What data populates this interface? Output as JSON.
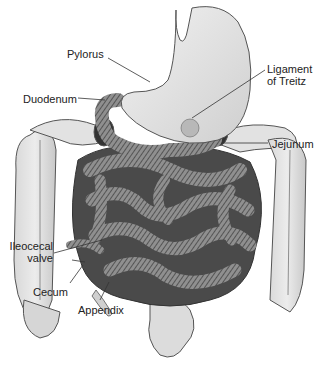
{
  "labels": {
    "pylorus": "Pylorus",
    "duodenum": "Duodenum",
    "ligament_line1": "Ligament",
    "ligament_line2": "of Treitz",
    "jejunum": "Jejunum",
    "ileocecal_line1": "Ileocecal",
    "ileocecal_line2": "valve",
    "cecum": "Cecum",
    "appendix": "Appendix"
  },
  "colors": {
    "background": "#ffffff",
    "organ_fill": "#e6e6e6",
    "organ_dark": "#9a9a9a",
    "outline": "#555555",
    "leader": "#333333"
  }
}
